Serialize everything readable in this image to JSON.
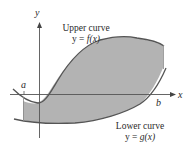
{
  "diagram": {
    "axes": {
      "x_label": "x",
      "y_label": "y"
    },
    "bounds": {
      "a_label": "a",
      "b_label": "b"
    },
    "upper_curve": {
      "title": "Upper curve",
      "equation_lhs": "y = ",
      "equation_fn": "f",
      "equation_arg": "(x)"
    },
    "lower_curve": {
      "title": "Lower curve",
      "equation_lhs": "y = ",
      "equation_fn": "g",
      "equation_arg": "(x)"
    },
    "colors": {
      "region_fill": "#b3b3b3",
      "curve_stroke": "#555555",
      "axis_stroke": "#555555"
    }
  }
}
